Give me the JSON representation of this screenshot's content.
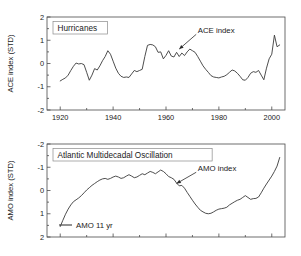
{
  "figure": {
    "background": "#ffffff",
    "line_color": "#3a3a3a",
    "frame_color": "#4a4a4a"
  },
  "chart_data": [
    {
      "type": "line",
      "panel": "top",
      "title": "Hurricanes",
      "xlabel": "",
      "ylabel": "ACE index (STD)",
      "xlim": [
        1915,
        2005
      ],
      "ylim": [
        -2,
        2
      ],
      "y_inverted": false,
      "grid": false,
      "legend": "none",
      "xticks": [
        1920,
        1940,
        1960,
        1980,
        2000
      ],
      "xtick_labels": [
        "1920",
        "1940",
        "1960",
        "1980",
        "2000"
      ],
      "yticks": [
        2,
        1,
        0,
        -1,
        -2
      ],
      "ytick_labels": [
        "2",
        "1",
        "0",
        "-1",
        "-2"
      ],
      "annotations": [
        {
          "text": "ACE index",
          "x": 1972,
          "y": 1.32,
          "points_to_x": 1965,
          "points_to_y": 0.62
        }
      ],
      "series": [
        {
          "name": "ACE index",
          "x": [
            1920,
            1921,
            1922,
            1923,
            1924,
            1925,
            1926,
            1927,
            1928,
            1929,
            1930,
            1931,
            1932,
            1933,
            1934,
            1935,
            1936,
            1937,
            1938,
            1939,
            1940,
            1941,
            1942,
            1943,
            1944,
            1945,
            1946,
            1947,
            1948,
            1949,
            1950,
            1951,
            1952,
            1953,
            1954,
            1955,
            1956,
            1957,
            1958,
            1959,
            1960,
            1961,
            1962,
            1963,
            1964,
            1965,
            1966,
            1967,
            1968,
            1969,
            1970,
            1971,
            1972,
            1973,
            1974,
            1975,
            1976,
            1977,
            1978,
            1979,
            1980,
            1981,
            1982,
            1983,
            1984,
            1985,
            1986,
            1987,
            1988,
            1989,
            1990,
            1991,
            1992,
            1993,
            1994,
            1995,
            1996,
            1997,
            1998,
            1999,
            2000,
            2001,
            2002,
            2003
          ],
          "values": [
            -0.75,
            -0.68,
            -0.62,
            -0.5,
            -0.3,
            -0.12,
            0.02,
            -0.02,
            0.0,
            -0.05,
            -0.38,
            -0.72,
            -0.5,
            -0.22,
            -0.28,
            -0.1,
            0.12,
            0.3,
            0.55,
            0.4,
            0.1,
            -0.2,
            -0.42,
            -0.55,
            -0.6,
            -0.58,
            -0.6,
            -0.45,
            -0.3,
            -0.35,
            -0.3,
            -0.25,
            0.3,
            0.78,
            0.82,
            0.8,
            0.72,
            0.48,
            0.5,
            0.2,
            0.35,
            0.55,
            0.32,
            0.28,
            0.48,
            0.3,
            0.45,
            0.34,
            0.5,
            0.62,
            0.55,
            0.48,
            0.3,
            0.1,
            -0.1,
            -0.25,
            -0.38,
            -0.52,
            -0.58,
            -0.6,
            -0.62,
            -0.58,
            -0.55,
            -0.48,
            -0.38,
            -0.28,
            -0.32,
            -0.42,
            -0.55,
            -0.7,
            -0.72,
            -0.6,
            -0.42,
            -0.35,
            -0.38,
            -0.3,
            -0.5,
            -0.7,
            -0.2,
            0.2,
            0.4,
            1.22,
            0.72,
            0.8
          ]
        }
      ]
    },
    {
      "type": "line",
      "panel": "bottom",
      "title": "Atlantic Multidecadal Oscillation",
      "xlabel": "",
      "ylabel": "AMO index (STD)",
      "xlim": [
        1915,
        2005
      ],
      "ylim": [
        -2,
        2
      ],
      "y_inverted": true,
      "grid": false,
      "legend": "inside-lower-left",
      "xticks": [
        1920,
        1940,
        1960,
        1980,
        2000
      ],
      "xtick_labels": [],
      "yticks": [
        -2,
        -1,
        0,
        1,
        2
      ],
      "ytick_labels": [
        "-2",
        "-1",
        "0",
        "1",
        "2"
      ],
      "annotations": [
        {
          "text": "AMO index",
          "x": 1972,
          "y": -0.85,
          "points_to_x": 1964,
          "points_to_y": -0.3
        }
      ],
      "legend_entries": [
        {
          "label": "AMO 11 yr",
          "color": "#3a3a3a"
        }
      ],
      "series": [
        {
          "name": "AMO 11 yr",
          "x": [
            1920,
            1921,
            1922,
            1923,
            1924,
            1925,
            1926,
            1927,
            1928,
            1929,
            1930,
            1931,
            1932,
            1933,
            1934,
            1935,
            1936,
            1937,
            1938,
            1939,
            1940,
            1941,
            1942,
            1943,
            1944,
            1945,
            1946,
            1947,
            1948,
            1949,
            1950,
            1951,
            1952,
            1953,
            1954,
            1955,
            1956,
            1957,
            1958,
            1959,
            1960,
            1961,
            1962,
            1963,
            1964,
            1965,
            1966,
            1967,
            1968,
            1969,
            1970,
            1971,
            1972,
            1973,
            1974,
            1975,
            1976,
            1977,
            1978,
            1979,
            1980,
            1981,
            1982,
            1983,
            1984,
            1985,
            1986,
            1987,
            1988,
            1989,
            1990,
            1991,
            1992,
            1993,
            1994,
            1995,
            1996,
            1997,
            1998,
            1999,
            2000,
            2001,
            2002,
            2003
          ],
          "values": [
            1.55,
            1.28,
            1.02,
            0.8,
            0.62,
            0.48,
            0.4,
            0.32,
            0.22,
            0.1,
            -0.02,
            -0.12,
            -0.22,
            -0.3,
            -0.38,
            -0.45,
            -0.5,
            -0.52,
            -0.48,
            -0.52,
            -0.58,
            -0.62,
            -0.58,
            -0.52,
            -0.55,
            -0.62,
            -0.68,
            -0.62,
            -0.55,
            -0.58,
            -0.65,
            -0.72,
            -0.68,
            -0.75,
            -0.82,
            -0.78,
            -0.72,
            -0.8,
            -0.88,
            -0.82,
            -0.72,
            -0.6,
            -0.55,
            -0.48,
            -0.32,
            -0.2,
            -0.22,
            -0.1,
            0.08,
            0.25,
            0.42,
            0.58,
            0.72,
            0.85,
            0.92,
            0.98,
            1.0,
            0.98,
            0.92,
            0.85,
            0.8,
            0.78,
            0.76,
            0.72,
            0.62,
            0.55,
            0.48,
            0.42,
            0.38,
            0.3,
            0.22,
            0.3,
            0.38,
            0.35,
            0.34,
            0.28,
            0.1,
            -0.1,
            -0.28,
            -0.45,
            -0.62,
            -0.82,
            -1.05,
            -1.42
          ]
        }
      ]
    }
  ]
}
